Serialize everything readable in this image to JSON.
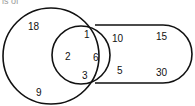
{
  "header": {
    "cut_text": "is of"
  },
  "diagram": {
    "type": "venn",
    "sets": [
      {
        "name": "large-circle",
        "shape": "circle"
      },
      {
        "name": "small-circle",
        "shape": "circle"
      },
      {
        "name": "stadium",
        "shape": "rounded-rectangle"
      }
    ],
    "regions": {
      "large_only": [
        "18",
        "9"
      ],
      "small_circle_inner": [
        "1",
        "2",
        "3"
      ],
      "small_and_stadium": [
        "6"
      ],
      "stadium_only": [
        "10",
        "15",
        "5",
        "30"
      ]
    },
    "labels": {
      "n18": "18",
      "n9": "9",
      "n1": "1",
      "n2": "2",
      "n6": "6",
      "n3": "3",
      "n10": "10",
      "n15": "15",
      "n5": "5",
      "n30": "30"
    },
    "stroke_color": "#111111"
  }
}
